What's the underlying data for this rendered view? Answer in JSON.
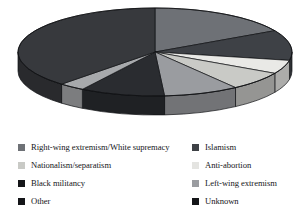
{
  "chart_data": {
    "type": "pie",
    "title": "",
    "subtitle": "",
    "xlabel": "",
    "ylabel": "",
    "legend_position": "bottom",
    "grid": false,
    "three_d": true,
    "start_angle_deg": 0,
    "direction": "clockwise",
    "categories": [
      "Right-wing extremism/White supremacy",
      "Islamism",
      "Anti-abortion",
      "Nationalism/separatism",
      "Left-wing extremism",
      "Unknown",
      "Black militancy",
      "Other"
    ],
    "values": [
      17,
      11,
      5,
      7,
      9,
      10,
      3,
      38
    ],
    "slices": [
      {
        "label": "Right-wing extremism/White supremacy",
        "value": 17,
        "color": "#6e7176",
        "start_deg": 0,
        "end_deg": 61
      },
      {
        "label": "Islamism",
        "value": 11,
        "color": "#3e4146",
        "start_deg": 61,
        "end_deg": 101
      },
      {
        "label": "Anti-abortion",
        "value": 5,
        "color": "#e9e9e6",
        "start_deg": 101,
        "end_deg": 119
      },
      {
        "label": "Nationalism/separatism",
        "value": 7,
        "color": "#c9cac6",
        "start_deg": 119,
        "end_deg": 144
      },
      {
        "label": "Left-wing extremism",
        "value": 9,
        "color": "#9a9ca0",
        "start_deg": 144,
        "end_deg": 176
      },
      {
        "label": "Unknown",
        "value": 10,
        "color": "#2a2c30",
        "start_deg": 176,
        "end_deg": 212
      },
      {
        "label": "Black militancy",
        "value": 3,
        "color": "#a7a9ac",
        "start_deg": 212,
        "end_deg": 223
      },
      {
        "label": "Other",
        "value": 38,
        "color": "#37393d",
        "start_deg": 223,
        "end_deg": 360
      }
    ]
  },
  "legend": {
    "columns": [
      {
        "items": [
          {
            "label": "Right-wing extremism/White supremacy",
            "color": "#6e7176"
          },
          {
            "label": "Nationalism/separatism",
            "color": "#c9cac6"
          },
          {
            "label": "Black militancy",
            "color": "#141518"
          },
          {
            "label": "Other",
            "color": "#141518"
          }
        ]
      },
      {
        "items": [
          {
            "label": "Islamism",
            "color": "#3e4146"
          },
          {
            "label": "Anti-abortion",
            "color": "#e4e4e1"
          },
          {
            "label": "Left-wing extremism",
            "color": "#9a9ca0"
          },
          {
            "label": "Unknown",
            "color": "#141518"
          }
        ]
      }
    ]
  },
  "geometry": {
    "cx": 155,
    "cy": 52,
    "rx": 137,
    "ry": 44,
    "depth": 19
  }
}
